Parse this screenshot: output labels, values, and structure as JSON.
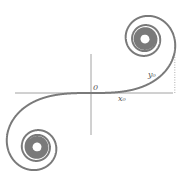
{
  "diagram": {
    "type": "euler-spiral",
    "colors": {
      "curve": "#7a7a7a",
      "axes": "#8a8a8a",
      "dotted": "#9a9a9a",
      "label": "#555555"
    },
    "origin_px": [
      91,
      93
    ],
    "scale_px_per_unit": 108,
    "t_max": 6.5,
    "labels": {
      "origin": "0",
      "x0": "x₀",
      "y0": "y₀"
    },
    "marker_t": 1.05
  }
}
